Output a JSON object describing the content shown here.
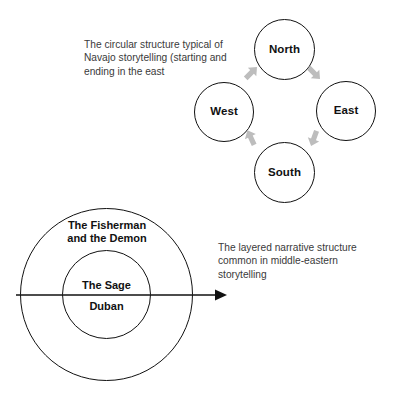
{
  "page": {
    "background_color": "#ffffff",
    "ink_color": "#111111",
    "caption_color": "#3a3a3a",
    "arrow_color": "#b8b8b8"
  },
  "navajo_diagram": {
    "name": "circular-structure-diagram",
    "caption": "The circular structure typical of Navajo storytelling (starting and ending in the east",
    "nodes": [
      {
        "id": "north",
        "label": "North"
      },
      {
        "id": "east",
        "label": "East"
      },
      {
        "id": "west",
        "label": "West"
      },
      {
        "id": "south",
        "label": "South"
      }
    ],
    "arrows": [
      {
        "id": "west-north",
        "from": "West",
        "to": "North",
        "direction": "up-right",
        "icon": "arrow-up-right-icon"
      },
      {
        "id": "north-east",
        "from": "North",
        "to": "East",
        "direction": "down-right",
        "icon": "arrow-down-right-icon"
      },
      {
        "id": "east-south",
        "from": "East",
        "to": "South",
        "direction": "down-left",
        "icon": "arrow-down-left-icon"
      },
      {
        "id": "south-west",
        "from": "South",
        "to": "West",
        "direction": "up-left",
        "icon": "arrow-up-left-icon"
      }
    ]
  },
  "layered_diagram": {
    "name": "layered-narrative-diagram",
    "caption": "The layered narrative structure common in middle-eastern storytelling",
    "outer_story_label": "The Fisherman\nand the Demon",
    "inner_story_label_top": "The Sage",
    "inner_story_label_bottom": "Duban",
    "axis_arrow": {
      "icon": "arrow-right-icon",
      "direction": "right"
    }
  }
}
